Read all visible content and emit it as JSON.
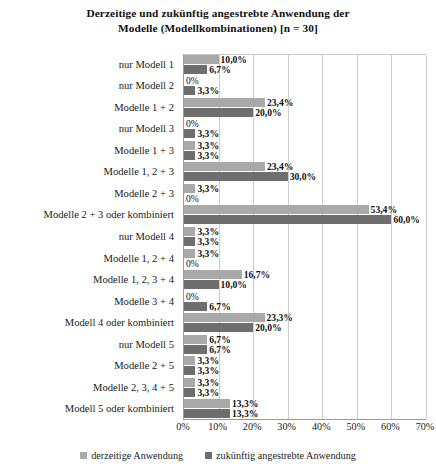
{
  "chart_data": {
    "type": "bar",
    "orientation": "horizontal",
    "title": "Derzeitige und zukünftig angestrebte Anwendung der Modelle (Modellkombinationen) [n = 30]",
    "title_lines": [
      "Derzeitige und zukünftig angestrebte Anwendung der",
      "Modelle (Modellkombinationen) [n = 30]"
    ],
    "xlabel": "",
    "ylabel": "",
    "xlim": [
      0,
      70
    ],
    "grid": true,
    "legend_position": "bottom",
    "tick_labels": [
      "0%",
      "10%",
      "20%",
      "30%",
      "40%",
      "50%",
      "60%",
      "70%"
    ],
    "tick_values": [
      0,
      10,
      20,
      30,
      40,
      50,
      60,
      70
    ],
    "categories": [
      "nur Modell 1",
      "nur Modell 2",
      "Modelle 1 + 2",
      "nur Modell 3",
      "Modelle 1 + 3",
      "Modelle 1, 2 + 3",
      "Modelle 2 + 3",
      "Modelle 2 + 3 oder kombiniert",
      "nur Modell 4",
      "Modelle 1, 2 + 4",
      "Modelle 1, 2, 3 + 4",
      "Modelle 3 + 4",
      "Modell 4 oder kombiniert",
      "nur Modell 5",
      "Modelle 2 + 5",
      "Modelle 2, 3, 4 + 5",
      "Modell 5 oder kombiniert"
    ],
    "series": [
      {
        "name": "derzeitige Anwendung",
        "color": "#a9a9a9",
        "values": [
          10.0,
          0,
          23.4,
          0,
          3.3,
          23.4,
          3.3,
          53.4,
          3.3,
          3.3,
          16.7,
          0,
          23.3,
          6.7,
          3.3,
          3.3,
          13.3
        ],
        "labels": [
          "10,0%",
          "0%",
          "23,4%",
          "0%",
          "3,3%",
          "23,4%",
          "3,3%",
          "53,4%",
          "3,3%",
          "3,3%",
          "16,7%",
          "0%",
          "23,3%",
          "6,7%",
          "3,3%",
          "3,3%",
          "13,3%"
        ]
      },
      {
        "name": "zukünftig angestrebte Anwendung",
        "color": "#6e6e6e",
        "values": [
          6.7,
          3.3,
          20.0,
          3.3,
          3.3,
          30.0,
          0,
          60.0,
          3.3,
          0,
          10.0,
          6.7,
          20.0,
          6.7,
          3.3,
          3.3,
          13.3
        ],
        "labels": [
          "6,7%",
          "3,3%",
          "20,0%",
          "3,3%",
          "3,3%",
          "30,0%",
          "0%",
          "60,0%",
          "3,3%",
          "0%",
          "10,0%",
          "6,7%",
          "20,0%",
          "6,7%",
          "3,3%",
          "3,3%",
          "13,3%"
        ]
      }
    ]
  },
  "legend": {
    "items": [
      {
        "label": "derzeitige Anwendung"
      },
      {
        "label": "zukünftig angestrebte Anwendung"
      }
    ]
  }
}
